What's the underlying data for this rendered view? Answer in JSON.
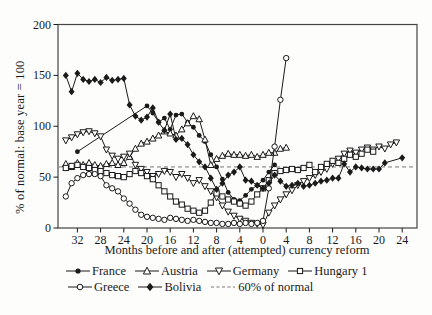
{
  "figure": {
    "background": "#fdfdfc",
    "foreground": "#1a1a1a",
    "border_color": "#444444",
    "reference_line_color": "#777777"
  },
  "chart_data": {
    "type": "line",
    "title": "",
    "xlabel": "Months before and after (attempted) currency reform",
    "ylabel": "% of normal: base year = 100",
    "grid": false,
    "legend_position": "bottom",
    "x_axis": {
      "tick_months": [
        -32,
        -28,
        -24,
        -20,
        -16,
        -12,
        -8,
        -4,
        0,
        4,
        8,
        12,
        16,
        20,
        24
      ],
      "tick_labels": [
        "32",
        "28",
        "24",
        "20",
        "16",
        "12",
        "8",
        "4",
        "0",
        "4",
        "8",
        "12",
        "16",
        "20",
        "24"
      ],
      "range": [
        -35.3,
        26.6
      ]
    },
    "y_axis": {
      "ticks": [
        0,
        50,
        100,
        150,
        200
      ],
      "tick_labels": [
        "0",
        "50",
        "100",
        "150",
        "200"
      ],
      "range": [
        0,
        200
      ]
    },
    "reference_line": {
      "label": "60% of normal",
      "value": 60,
      "style": "dashed"
    },
    "series": [
      {
        "name": "France",
        "marker": "filled-circle",
        "points": [
          [
            -32,
            75
          ],
          [
            -20,
            120
          ],
          [
            -19,
            113
          ],
          [
            -18,
            104
          ],
          [
            -17,
            108
          ],
          [
            -16,
            97
          ],
          [
            -15,
            111
          ],
          [
            -14,
            112
          ],
          [
            -13,
            104
          ],
          [
            -12,
            99
          ],
          [
            -11,
            91
          ],
          [
            -10,
            85
          ],
          [
            -9,
            72
          ],
          [
            -8,
            60
          ],
          [
            -7,
            48
          ],
          [
            -6,
            35
          ],
          [
            -5,
            28
          ],
          [
            -4,
            27
          ],
          [
            -3,
            32
          ],
          [
            -2,
            38
          ],
          [
            -1,
            42
          ],
          [
            0,
            47
          ],
          [
            1,
            55
          ],
          [
            2,
            62
          ]
        ]
      },
      {
        "name": "Austria",
        "marker": "open-triangle-up",
        "points": [
          [
            -34,
            63
          ],
          [
            -33,
            60
          ],
          [
            -32,
            64
          ],
          [
            -31,
            62
          ],
          [
            -30,
            64
          ],
          [
            -29,
            62
          ],
          [
            -28,
            61
          ],
          [
            -27,
            63
          ],
          [
            -26,
            64
          ],
          [
            -25,
            62
          ],
          [
            -24,
            64
          ],
          [
            -23,
            70
          ],
          [
            -22,
            78
          ],
          [
            -21,
            83
          ],
          [
            -20,
            85
          ],
          [
            -19,
            88
          ],
          [
            -18,
            91
          ],
          [
            -17,
            95
          ],
          [
            -16,
            93
          ],
          [
            -15,
            91
          ],
          [
            -14,
            97
          ],
          [
            -13,
            103
          ],
          [
            -12,
            110
          ],
          [
            -11,
            107
          ],
          [
            -10,
            87
          ],
          [
            -9,
            62
          ],
          [
            -8,
            68
          ],
          [
            -7,
            71
          ],
          [
            -6,
            73
          ],
          [
            -5,
            72
          ],
          [
            -4,
            72
          ],
          [
            -3,
            71
          ],
          [
            -2,
            72
          ],
          [
            -1,
            70
          ],
          [
            0,
            72
          ],
          [
            1,
            74
          ],
          [
            2,
            74
          ],
          [
            3,
            78
          ],
          [
            4,
            79
          ]
        ]
      },
      {
        "name": "Germany",
        "marker": "open-triangle-down",
        "points": [
          [
            -34,
            86
          ],
          [
            -33,
            89
          ],
          [
            -32,
            92
          ],
          [
            -31,
            94
          ],
          [
            -30,
            95
          ],
          [
            -29,
            93
          ],
          [
            -28,
            90
          ],
          [
            -27,
            77
          ],
          [
            -26,
            71
          ],
          [
            -25,
            68
          ],
          [
            -24,
            70
          ],
          [
            -23,
            73
          ],
          [
            -22,
            62
          ],
          [
            -21,
            58
          ],
          [
            -20,
            55
          ],
          [
            -19,
            51
          ],
          [
            -18,
            53
          ],
          [
            -17,
            56
          ],
          [
            -16,
            55
          ],
          [
            -15,
            50
          ],
          [
            -14,
            53
          ],
          [
            -13,
            49
          ],
          [
            -12,
            44
          ],
          [
            -11,
            47
          ],
          [
            -10,
            41
          ],
          [
            -9,
            36
          ],
          [
            -8,
            30
          ],
          [
            -7,
            22
          ],
          [
            -6,
            16
          ],
          [
            -5,
            12
          ],
          [
            -4,
            9
          ],
          [
            -3,
            7
          ],
          [
            -2,
            5
          ],
          [
            -1,
            4
          ],
          [
            0,
            3
          ],
          [
            1,
            15
          ],
          [
            2,
            22
          ],
          [
            3,
            28
          ],
          [
            4,
            33
          ],
          [
            5,
            37
          ],
          [
            6,
            42
          ],
          [
            7,
            46
          ],
          [
            8,
            49
          ],
          [
            9,
            52
          ],
          [
            10,
            55
          ],
          [
            11,
            58
          ],
          [
            12,
            63
          ],
          [
            13,
            68
          ],
          [
            14,
            73
          ],
          [
            15,
            76
          ],
          [
            16,
            74
          ],
          [
            17,
            77
          ],
          [
            18,
            79
          ],
          [
            19,
            77
          ],
          [
            20,
            80
          ],
          [
            21,
            78
          ],
          [
            22,
            82
          ],
          [
            23,
            84
          ]
        ]
      },
      {
        "name": "Hungary 1",
        "marker": "open-square",
        "points": [
          [
            -34,
            59
          ],
          [
            -33,
            61
          ],
          [
            -32,
            62
          ],
          [
            -31,
            60
          ],
          [
            -30,
            59
          ],
          [
            -29,
            57
          ],
          [
            -28,
            56
          ],
          [
            -27,
            54
          ],
          [
            -26,
            52
          ],
          [
            -25,
            51
          ],
          [
            -24,
            50
          ],
          [
            -23,
            53
          ],
          [
            -22,
            56
          ],
          [
            -21,
            54
          ],
          [
            -20,
            51
          ],
          [
            -19,
            48
          ],
          [
            -18,
            42
          ],
          [
            -17,
            36
          ],
          [
            -16,
            31
          ],
          [
            -15,
            26
          ],
          [
            -14,
            23
          ],
          [
            -13,
            19
          ],
          [
            -12,
            17
          ],
          [
            -11,
            15
          ],
          [
            -10,
            17
          ],
          [
            -9,
            25
          ],
          [
            -8,
            34
          ],
          [
            -7,
            31
          ],
          [
            -6,
            28
          ],
          [
            -5,
            26
          ],
          [
            -4,
            24
          ],
          [
            -3,
            22
          ],
          [
            -2,
            26
          ],
          [
            -1,
            33
          ],
          [
            0,
            39
          ],
          [
            1,
            47
          ],
          [
            2,
            54
          ],
          [
            3,
            56
          ],
          [
            4,
            57
          ],
          [
            5,
            58
          ],
          [
            6,
            57
          ],
          [
            7,
            59
          ],
          [
            8,
            62
          ],
          [
            9,
            55
          ],
          [
            10,
            60
          ],
          [
            11,
            63
          ],
          [
            12,
            66
          ],
          [
            13,
            64
          ],
          [
            14,
            68
          ],
          [
            15,
            72
          ],
          [
            16,
            70
          ],
          [
            17,
            73
          ],
          [
            18,
            77
          ],
          [
            19,
            75
          ]
        ]
      },
      {
        "name": "Greece",
        "marker": "open-circle",
        "points": [
          [
            -34,
            31
          ],
          [
            -33,
            44
          ],
          [
            -32,
            49
          ],
          [
            -31,
            52
          ],
          [
            -30,
            53
          ],
          [
            -29,
            53
          ],
          [
            -28,
            51
          ],
          [
            -27,
            42
          ],
          [
            -26,
            39
          ],
          [
            -25,
            36
          ],
          [
            -24,
            29
          ],
          [
            -23,
            24
          ],
          [
            -22,
            18
          ],
          [
            -21,
            13
          ],
          [
            -20,
            11
          ],
          [
            -19,
            10
          ],
          [
            -18,
            9
          ],
          [
            -17,
            8
          ],
          [
            -16,
            10
          ],
          [
            -15,
            9
          ],
          [
            -14,
            8
          ],
          [
            -13,
            7
          ],
          [
            -12,
            8
          ],
          [
            -11,
            7
          ],
          [
            -10,
            6
          ],
          [
            -9,
            5
          ],
          [
            -8,
            5
          ],
          [
            -7,
            4
          ],
          [
            -6,
            4
          ],
          [
            -5,
            5
          ],
          [
            -4,
            4
          ],
          [
            -3,
            5
          ],
          [
            -2,
            4
          ],
          [
            -1,
            5
          ],
          [
            0,
            7
          ],
          [
            1,
            39
          ],
          [
            2,
            80
          ],
          [
            3,
            126
          ],
          [
            4,
            167
          ]
        ]
      },
      {
        "name": "Bolivia",
        "marker": "filled-diamond",
        "points": [
          [
            -34,
            150
          ],
          [
            -33,
            134
          ],
          [
            -32,
            152
          ],
          [
            -31,
            146
          ],
          [
            -30,
            144
          ],
          [
            -29,
            146
          ],
          [
            -28,
            143
          ],
          [
            -27,
            148
          ],
          [
            -26,
            145
          ],
          [
            -25,
            146
          ],
          [
            -24,
            147
          ],
          [
            -23,
            121
          ],
          [
            -22,
            110
          ],
          [
            -21,
            106
          ],
          [
            -20,
            109
          ],
          [
            -19,
            118
          ],
          [
            -18,
            104
          ],
          [
            -17,
            96
          ],
          [
            -16,
            112
          ],
          [
            -15,
            87
          ],
          [
            -14,
            88
          ],
          [
            -13,
            82
          ],
          [
            -12,
            72
          ],
          [
            -11,
            65
          ],
          [
            -10,
            60
          ],
          [
            -9,
            49
          ],
          [
            -8,
            38
          ],
          [
            -7,
            44
          ],
          [
            -6,
            52
          ],
          [
            -5,
            55
          ],
          [
            -4,
            60
          ],
          [
            -3,
            47
          ],
          [
            -2,
            46
          ],
          [
            -1,
            42
          ],
          [
            0,
            39
          ],
          [
            1,
            44
          ],
          [
            2,
            52
          ],
          [
            3,
            46
          ],
          [
            4,
            41
          ],
          [
            5,
            42
          ],
          [
            6,
            44
          ],
          [
            7,
            41
          ],
          [
            8,
            42
          ],
          [
            9,
            44
          ],
          [
            10,
            46
          ],
          [
            11,
            47
          ],
          [
            12,
            49
          ],
          [
            13,
            49
          ],
          [
            14,
            63
          ],
          [
            15,
            55
          ],
          [
            16,
            60
          ],
          [
            17,
            59
          ],
          [
            18,
            58
          ],
          [
            19,
            58
          ],
          [
            20,
            58
          ],
          [
            21,
            64
          ],
          [
            24,
            69
          ]
        ]
      }
    ],
    "legend_rows": [
      [
        "France",
        "Austria",
        "Germany",
        "Hungary 1"
      ],
      [
        "Greece",
        "Bolivia",
        "60% of normal"
      ]
    ]
  }
}
